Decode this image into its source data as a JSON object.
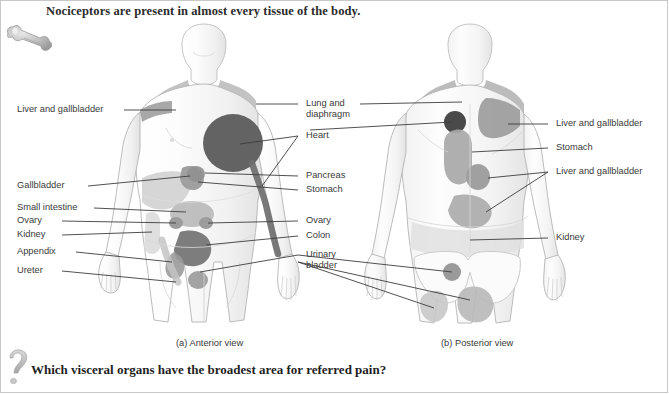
{
  "figure": {
    "title": "Nociceptors are present in almost every tissue of the body.",
    "question": "Which visceral organs have the broadest area for referred pain?",
    "bone_icon_name": "bone-icon",
    "question_icon_name": "question-mark-icon",
    "background_color": "#ffffff",
    "text_color": "#3a3a3a",
    "title_color": "#2b2b2b"
  },
  "panels": [
    {
      "id": "anterior",
      "caption": "(a) Anterior view"
    },
    {
      "id": "posterior",
      "caption": "(b) Posterior view"
    }
  ],
  "labels": {
    "left": [
      {
        "text": "Liver and gallbladder",
        "organ": "liver-gallbladder"
      },
      {
        "text": "Gallbladder",
        "organ": "gallbladder"
      },
      {
        "text": "Small intestine",
        "organ": "small-intestine"
      },
      {
        "text": "Ovary",
        "organ": "ovary"
      },
      {
        "text": "Kidney",
        "organ": "kidney"
      },
      {
        "text": "Appendix",
        "organ": "appendix"
      },
      {
        "text": "Ureter",
        "organ": "ureter"
      }
    ],
    "center": [
      {
        "text": "Lung and",
        "text2": "diaphragm",
        "organ": "lung-diaphragm"
      },
      {
        "text": "Heart",
        "organ": "heart"
      },
      {
        "text": "Pancreas",
        "organ": "pancreas"
      },
      {
        "text": "Stomach",
        "organ": "stomach"
      },
      {
        "text": "Ovary",
        "organ": "ovary"
      },
      {
        "text": "Colon",
        "organ": "colon"
      },
      {
        "text": "Urinary",
        "text2": "bladder",
        "organ": "urinary-bladder"
      }
    ],
    "right": [
      {
        "text": "Liver and gallbladder",
        "organ": "liver-gallbladder"
      },
      {
        "text": "Stomach",
        "organ": "stomach"
      },
      {
        "text": "Liver and gallbladder",
        "organ": "liver-gallbladder-2"
      },
      {
        "text": "Kidney",
        "organ": "kidney"
      }
    ]
  },
  "colors": {
    "pain_dark": "#636363",
    "pain_mid": "#a9a9a9",
    "pain_light": "#c4c4c4",
    "pain_pale": "#dcdcdc",
    "body_fill": "#fafafa",
    "body_stroke": "#b4b4b4",
    "leader_line": "#3d3d3d"
  }
}
